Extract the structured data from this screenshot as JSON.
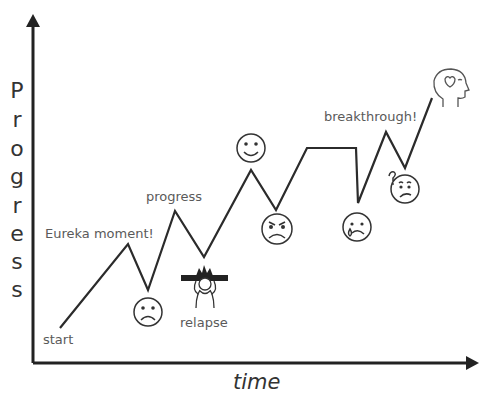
{
  "diagram": {
    "type": "progress-journey",
    "y_axis_label": "Progress",
    "y_axis_letters": [
      "P",
      "r",
      "o",
      "g",
      "r",
      "e",
      "s",
      "s"
    ],
    "x_axis_label": "time",
    "labels": {
      "start": "start",
      "eureka": "Eureka moment!",
      "progress": "progress",
      "relapse": "relapse",
      "breakthrough": "breakthrough!"
    },
    "path_points": [
      [
        60,
        328
      ],
      [
        128,
        244
      ],
      [
        148,
        290
      ],
      [
        175,
        211
      ],
      [
        204,
        257
      ],
      [
        251,
        170
      ],
      [
        276,
        210
      ],
      [
        307,
        148
      ],
      [
        356,
        148
      ],
      [
        358,
        203
      ],
      [
        386,
        132
      ],
      [
        405,
        168
      ],
      [
        432,
        98
      ]
    ],
    "icons": [
      {
        "name": "sad-face-icon",
        "meaning": "sad"
      },
      {
        "name": "relapse-person-icon",
        "meaning": "frustrated person holding head"
      },
      {
        "name": "happy-face-icon",
        "meaning": "happy"
      },
      {
        "name": "angry-face-icon",
        "meaning": "angry"
      },
      {
        "name": "crying-face-icon",
        "meaning": "crying"
      },
      {
        "name": "confused-face-icon",
        "meaning": "confused"
      },
      {
        "name": "head-heart-icon",
        "meaning": "mind with heart"
      }
    ],
    "colors": {
      "line": "#2b2b2b",
      "axis": "#222222",
      "label_text": "#5a5a5a",
      "icon_stroke": "#333333"
    }
  }
}
